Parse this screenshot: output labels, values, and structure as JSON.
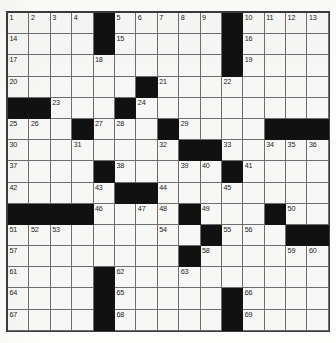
{
  "puzzle": {
    "type": "crossword-grid",
    "rows": 15,
    "columns": 15,
    "colors": {
      "block": "#111111",
      "open_cell": "#f7f7f5",
      "grid_line": "#6e6e6e",
      "frame": "#3a3a3a",
      "number_text": "#1b1b1b",
      "page_background": "#ffffff"
    },
    "block_count": 60,
    "clue_number_count": 69,
    "highest_clue_number": "69",
    "grid": [
      [
        {
          "block": false,
          "number": "1"
        },
        {
          "block": false,
          "number": "2"
        },
        {
          "block": false,
          "number": "3"
        },
        {
          "block": false,
          "number": "4"
        },
        {
          "block": true,
          "number": ""
        },
        {
          "block": false,
          "number": "5"
        },
        {
          "block": false,
          "number": "6"
        },
        {
          "block": false,
          "number": "7"
        },
        {
          "block": false,
          "number": "8"
        },
        {
          "block": false,
          "number": "9"
        },
        {
          "block": true,
          "number": ""
        },
        {
          "block": false,
          "number": "10"
        },
        {
          "block": false,
          "number": "11"
        },
        {
          "block": false,
          "number": "12"
        },
        {
          "block": false,
          "number": "13"
        }
      ],
      [
        {
          "block": false,
          "number": "14"
        },
        {
          "block": false,
          "number": ""
        },
        {
          "block": false,
          "number": ""
        },
        {
          "block": false,
          "number": ""
        },
        {
          "block": true,
          "number": ""
        },
        {
          "block": false,
          "number": "15"
        },
        {
          "block": false,
          "number": ""
        },
        {
          "block": false,
          "number": ""
        },
        {
          "block": false,
          "number": ""
        },
        {
          "block": false,
          "number": ""
        },
        {
          "block": true,
          "number": ""
        },
        {
          "block": false,
          "number": "16"
        },
        {
          "block": false,
          "number": ""
        },
        {
          "block": false,
          "number": ""
        },
        {
          "block": false,
          "number": ""
        }
      ],
      [
        {
          "block": false,
          "number": "17"
        },
        {
          "block": false,
          "number": ""
        },
        {
          "block": false,
          "number": ""
        },
        {
          "block": false,
          "number": ""
        },
        {
          "block": false,
          "number": "18"
        },
        {
          "block": false,
          "number": ""
        },
        {
          "block": false,
          "number": ""
        },
        {
          "block": false,
          "number": ""
        },
        {
          "block": false,
          "number": ""
        },
        {
          "block": false,
          "number": ""
        },
        {
          "block": true,
          "number": ""
        },
        {
          "block": false,
          "number": "19"
        },
        {
          "block": false,
          "number": ""
        },
        {
          "block": false,
          "number": ""
        },
        {
          "block": false,
          "number": ""
        }
      ],
      [
        {
          "block": false,
          "number": "20"
        },
        {
          "block": false,
          "number": ""
        },
        {
          "block": false,
          "number": ""
        },
        {
          "block": false,
          "number": ""
        },
        {
          "block": false,
          "number": ""
        },
        {
          "block": false,
          "number": ""
        },
        {
          "block": true,
          "number": ""
        },
        {
          "block": false,
          "number": "21"
        },
        {
          "block": false,
          "number": ""
        },
        {
          "block": false,
          "number": ""
        },
        {
          "block": false,
          "number": "22"
        },
        {
          "block": false,
          "number": ""
        },
        {
          "block": false,
          "number": ""
        },
        {
          "block": false,
          "number": ""
        },
        {
          "block": false,
          "number": ""
        }
      ],
      [
        {
          "block": true,
          "number": ""
        },
        {
          "block": true,
          "number": ""
        },
        {
          "block": false,
          "number": "23"
        },
        {
          "block": false,
          "number": ""
        },
        {
          "block": false,
          "number": ""
        },
        {
          "block": true,
          "number": ""
        },
        {
          "block": false,
          "number": "24"
        },
        {
          "block": false,
          "number": ""
        },
        {
          "block": false,
          "number": ""
        },
        {
          "block": false,
          "number": ""
        },
        {
          "block": false,
          "number": ""
        },
        {
          "block": false,
          "number": ""
        },
        {
          "block": false,
          "number": ""
        },
        {
          "block": false,
          "number": ""
        },
        {
          "block": false,
          "number": ""
        }
      ],
      [
        {
          "block": false,
          "number": "25"
        },
        {
          "block": false,
          "number": "26"
        },
        {
          "block": false,
          "number": ""
        },
        {
          "block": true,
          "number": ""
        },
        {
          "block": false,
          "number": "27"
        },
        {
          "block": false,
          "number": "28"
        },
        {
          "block": false,
          "number": ""
        },
        {
          "block": true,
          "number": ""
        },
        {
          "block": false,
          "number": "29"
        },
        {
          "block": false,
          "number": ""
        },
        {
          "block": false,
          "number": ""
        },
        {
          "block": false,
          "number": ""
        },
        {
          "block": true,
          "number": ""
        },
        {
          "block": true,
          "number": ""
        },
        {
          "block": true,
          "number": ""
        }
      ],
      [
        {
          "block": false,
          "number": "30"
        },
        {
          "block": false,
          "number": ""
        },
        {
          "block": false,
          "number": ""
        },
        {
          "block": false,
          "number": "31"
        },
        {
          "block": false,
          "number": ""
        },
        {
          "block": false,
          "number": ""
        },
        {
          "block": false,
          "number": ""
        },
        {
          "block": false,
          "number": "32"
        },
        {
          "block": true,
          "number": ""
        },
        {
          "block": true,
          "number": ""
        },
        {
          "block": false,
          "number": "33"
        },
        {
          "block": false,
          "number": ""
        },
        {
          "block": false,
          "number": "34"
        },
        {
          "block": false,
          "number": "35"
        },
        {
          "block": false,
          "number": "36"
        }
      ],
      [
        {
          "block": false,
          "number": "37"
        },
        {
          "block": false,
          "number": ""
        },
        {
          "block": false,
          "number": ""
        },
        {
          "block": false,
          "number": ""
        },
        {
          "block": true,
          "number": ""
        },
        {
          "block": false,
          "number": "38"
        },
        {
          "block": false,
          "number": ""
        },
        {
          "block": false,
          "number": ""
        },
        {
          "block": false,
          "number": "39"
        },
        {
          "block": false,
          "number": "40"
        },
        {
          "block": true,
          "number": ""
        },
        {
          "block": false,
          "number": "41"
        },
        {
          "block": false,
          "number": ""
        },
        {
          "block": false,
          "number": ""
        },
        {
          "block": false,
          "number": ""
        }
      ],
      [
        {
          "block": false,
          "number": "42"
        },
        {
          "block": false,
          "number": ""
        },
        {
          "block": false,
          "number": ""
        },
        {
          "block": false,
          "number": ""
        },
        {
          "block": false,
          "number": "43"
        },
        {
          "block": true,
          "number": ""
        },
        {
          "block": true,
          "number": ""
        },
        {
          "block": false,
          "number": "44"
        },
        {
          "block": false,
          "number": ""
        },
        {
          "block": false,
          "number": ""
        },
        {
          "block": false,
          "number": "45"
        },
        {
          "block": false,
          "number": ""
        },
        {
          "block": false,
          "number": ""
        },
        {
          "block": false,
          "number": ""
        },
        {
          "block": false,
          "number": ""
        }
      ],
      [
        {
          "block": true,
          "number": ""
        },
        {
          "block": true,
          "number": ""
        },
        {
          "block": true,
          "number": ""
        },
        {
          "block": true,
          "number": ""
        },
        {
          "block": false,
          "number": "46"
        },
        {
          "block": false,
          "number": ""
        },
        {
          "block": false,
          "number": "47"
        },
        {
          "block": false,
          "number": "48"
        },
        {
          "block": true,
          "number": ""
        },
        {
          "block": false,
          "number": "49"
        },
        {
          "block": false,
          "number": ""
        },
        {
          "block": false,
          "number": ""
        },
        {
          "block": true,
          "number": ""
        },
        {
          "block": false,
          "number": "50"
        },
        {
          "block": false,
          "number": ""
        }
      ],
      [
        {
          "block": false,
          "number": "51"
        },
        {
          "block": false,
          "number": "52"
        },
        {
          "block": false,
          "number": "53"
        },
        {
          "block": false,
          "number": ""
        },
        {
          "block": false,
          "number": ""
        },
        {
          "block": false,
          "number": ""
        },
        {
          "block": false,
          "number": ""
        },
        {
          "block": false,
          "number": "54"
        },
        {
          "block": false,
          "number": ""
        },
        {
          "block": true,
          "number": ""
        },
        {
          "block": false,
          "number": "55"
        },
        {
          "block": false,
          "number": "56"
        },
        {
          "block": false,
          "number": ""
        },
        {
          "block": true,
          "number": ""
        },
        {
          "block": true,
          "number": ""
        }
      ],
      [
        {
          "block": false,
          "number": "57"
        },
        {
          "block": false,
          "number": ""
        },
        {
          "block": false,
          "number": ""
        },
        {
          "block": false,
          "number": ""
        },
        {
          "block": false,
          "number": ""
        },
        {
          "block": false,
          "number": ""
        },
        {
          "block": false,
          "number": ""
        },
        {
          "block": false,
          "number": ""
        },
        {
          "block": true,
          "number": ""
        },
        {
          "block": false,
          "number": "58"
        },
        {
          "block": false,
          "number": ""
        },
        {
          "block": false,
          "number": ""
        },
        {
          "block": false,
          "number": ""
        },
        {
          "block": false,
          "number": "59"
        },
        {
          "block": false,
          "number": "60"
        }
      ],
      [
        {
          "block": false,
          "number": "61"
        },
        {
          "block": false,
          "number": ""
        },
        {
          "block": false,
          "number": ""
        },
        {
          "block": false,
          "number": ""
        },
        {
          "block": true,
          "number": ""
        },
        {
          "block": false,
          "number": "62"
        },
        {
          "block": false,
          "number": ""
        },
        {
          "block": false,
          "number": ""
        },
        {
          "block": false,
          "number": "63"
        },
        {
          "block": false,
          "number": ""
        },
        {
          "block": false,
          "number": ""
        },
        {
          "block": false,
          "number": ""
        },
        {
          "block": false,
          "number": ""
        },
        {
          "block": false,
          "number": ""
        },
        {
          "block": false,
          "number": ""
        }
      ],
      [
        {
          "block": false,
          "number": "64"
        },
        {
          "block": false,
          "number": ""
        },
        {
          "block": false,
          "number": ""
        },
        {
          "block": false,
          "number": ""
        },
        {
          "block": true,
          "number": ""
        },
        {
          "block": false,
          "number": "65"
        },
        {
          "block": false,
          "number": ""
        },
        {
          "block": false,
          "number": ""
        },
        {
          "block": false,
          "number": ""
        },
        {
          "block": false,
          "number": ""
        },
        {
          "block": true,
          "number": ""
        },
        {
          "block": false,
          "number": "66"
        },
        {
          "block": false,
          "number": ""
        },
        {
          "block": false,
          "number": ""
        },
        {
          "block": false,
          "number": ""
        }
      ],
      [
        {
          "block": false,
          "number": "67"
        },
        {
          "block": false,
          "number": ""
        },
        {
          "block": false,
          "number": ""
        },
        {
          "block": false,
          "number": ""
        },
        {
          "block": true,
          "number": ""
        },
        {
          "block": false,
          "number": "68"
        },
        {
          "block": false,
          "number": ""
        },
        {
          "block": false,
          "number": ""
        },
        {
          "block": false,
          "number": ""
        },
        {
          "block": false,
          "number": ""
        },
        {
          "block": true,
          "number": ""
        },
        {
          "block": false,
          "number": "69"
        },
        {
          "block": false,
          "number": ""
        },
        {
          "block": false,
          "number": ""
        },
        {
          "block": false,
          "number": ""
        }
      ]
    ]
  }
}
